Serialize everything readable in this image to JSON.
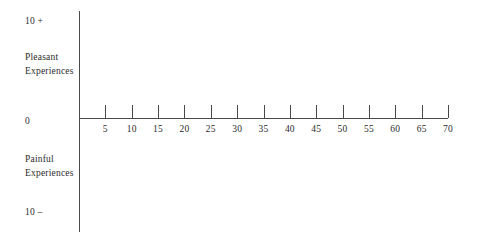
{
  "figure": {
    "background_color": "#ffffff",
    "line_color": "#4a4a4a",
    "text_color": "#2b2b2b"
  },
  "vertical_axis": {
    "top_label": "10 +",
    "upper_region_line1": "Pleasant",
    "upper_region_line2": "Experiences",
    "origin_label": "0",
    "lower_region_line1": "Painful",
    "lower_region_line2": "Experiences",
    "bottom_label": "10 –"
  },
  "chart_data": {
    "type": "scatter",
    "title": "",
    "subtitle": "",
    "xlabel": "",
    "ylabel": "",
    "x": [],
    "values": [],
    "series": [],
    "categories": [],
    "xlim": [
      0,
      70
    ],
    "ylim": [
      -10,
      10
    ],
    "xticks": [
      5,
      10,
      15,
      20,
      25,
      30,
      35,
      40,
      45,
      50,
      55,
      60,
      65,
      70
    ],
    "xtick_labels": [
      "5",
      "10",
      "15",
      "20",
      "25",
      "30",
      "35",
      "40",
      "45",
      "50",
      "55",
      "60",
      "65",
      "70"
    ],
    "yticks": [
      10,
      0,
      -10
    ],
    "ytick_labels": [
      "10 +",
      "0",
      "10 –"
    ],
    "y_annotations": [
      "Pleasant Experiences",
      "Painful Experiences"
    ],
    "grid": false,
    "legend": null,
    "legend_position": "none"
  }
}
